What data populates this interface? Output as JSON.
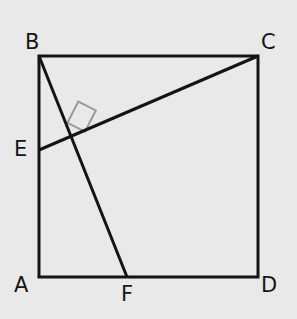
{
  "figure": {
    "background_color": "#e9e9e9",
    "stroke_color": "#141414",
    "right_angle_color": "#9a9a9a",
    "stroke_width": 3,
    "right_angle_stroke_width": 2,
    "canvas": {
      "width": 297,
      "height": 319
    },
    "vertices": [
      {
        "id": "B",
        "label": "B",
        "x": 39,
        "y": 56,
        "label_x": 25,
        "label_y": 32
      },
      {
        "id": "C",
        "label": "C",
        "x": 258,
        "y": 56,
        "label_x": 261,
        "label_y": 32
      },
      {
        "id": "E",
        "label": "E",
        "x": 39,
        "y": 150,
        "label_x": 14,
        "label_y": 139
      },
      {
        "id": "A",
        "label": "A",
        "x": 39,
        "y": 277,
        "label_x": 14,
        "label_y": 275
      },
      {
        "id": "F",
        "label": "F",
        "x": 127,
        "y": 277,
        "label_x": 121,
        "label_y": 284
      },
      {
        "id": "D",
        "label": "D",
        "x": 258,
        "y": 277,
        "label_x": 261,
        "label_y": 275
      }
    ],
    "square_path": "M 39 56 L 258 56 L 258 277 L 39 277 Z",
    "segment_bf": {
      "name": "BF",
      "x1": 39,
      "y1": 56,
      "x2": 127,
      "y2": 277
    },
    "segment_ec": {
      "name": "EC",
      "x1": 39,
      "y1": 150,
      "x2": 258,
      "y2": 56
    },
    "intersection": {
      "x": 73,
      "y": 137
    },
    "right_angle_marker_path": "M 67.5 122.8 L 78.3 101.5 L 95.8 110.4 L 85.0 131.7 Z"
  }
}
